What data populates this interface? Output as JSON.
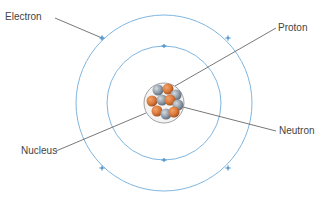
{
  "labels": {
    "electron": "Electron",
    "proton": "Proton",
    "neutron": "Neutron",
    "nucleus": "Nucleus"
  },
  "colors": {
    "orbit": "#7fb6e0",
    "electron": "#5b9bd0",
    "proton": "#d9773a",
    "neutron": "#8e9aa6",
    "leader": "#555555",
    "label": "#444444"
  },
  "atom": {
    "center": [
      164,
      103
    ],
    "inner_orbit_radius": 57,
    "outer_orbit_radius": 88,
    "nucleus_radius": 20,
    "inner_electrons": 2,
    "outer_electrons": 4
  }
}
